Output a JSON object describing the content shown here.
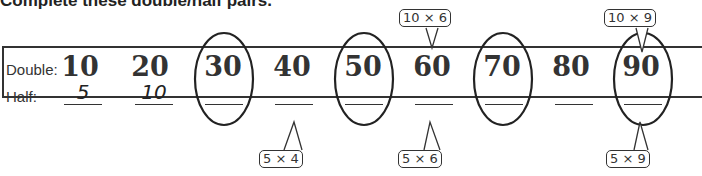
{
  "title": "Complete these double/half pairs.",
  "labels": {
    "double": "Double:",
    "half": "Half:"
  },
  "columns": [
    {
      "double": "10",
      "half": "5",
      "circled": false
    },
    {
      "double": "20",
      "half": "10",
      "circled": false
    },
    {
      "double": "30",
      "half": "",
      "circled": true
    },
    {
      "double": "40",
      "half": "",
      "circled": false
    },
    {
      "double": "50",
      "half": "",
      "circled": true
    },
    {
      "double": "60",
      "half": "",
      "circled": false
    },
    {
      "double": "70",
      "half": "",
      "circled": true
    },
    {
      "double": "80",
      "half": "",
      "circled": false
    },
    {
      "double": "90",
      "half": "",
      "circled": true
    }
  ],
  "hints": {
    "top_60": "10 × 6",
    "top_90": "10 × 9",
    "bottom_40": "5 × 4",
    "bottom_60": "5 × 6",
    "bottom_90": "5 × 9"
  }
}
